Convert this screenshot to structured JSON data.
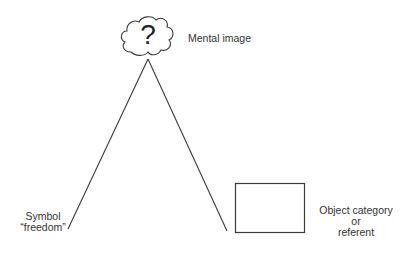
{
  "diagram": {
    "type": "semiotic-triangle",
    "nodes": {
      "mental_image": {
        "label": "Mental image",
        "symbol": "?",
        "shape": "cloud"
      },
      "symbol": {
        "label_line1": "Symbol",
        "label_line2": "“freedom”"
      },
      "referent": {
        "label_line1": "Object category",
        "label_line2": "or",
        "label_line3": "referent",
        "shape": "rectangle"
      }
    },
    "edges": [
      {
        "from": "mental_image",
        "to": "symbol"
      },
      {
        "from": "mental_image",
        "to": "referent"
      }
    ],
    "colors": {
      "stroke": "#333333",
      "text": "#333333",
      "background": "#ffffff"
    }
  }
}
